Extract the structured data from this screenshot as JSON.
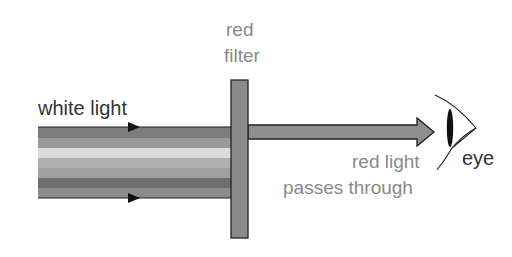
{
  "diagram": {
    "labels": {
      "white_light": "white light",
      "filter_line1": "red",
      "filter_line2": "filter",
      "red_light_line1": "red light",
      "red_light_line2": "passes through",
      "eye": "eye"
    },
    "beam_stripes": [
      "#7d7d7d",
      "#9a9a9a",
      "#dcdcdc",
      "#b0b0b0",
      "#a0a0a0",
      "#6e6e6e",
      "#8c8c8c"
    ],
    "colors": {
      "filter": "#8a8a8a",
      "output_beam": "#8f8f8f",
      "outline": "#222222",
      "label_dark": "#333333",
      "label_grey": "#8a8a8a"
    },
    "icons": [
      "arrow-right-icon",
      "eye-icon"
    ]
  }
}
